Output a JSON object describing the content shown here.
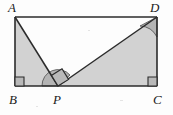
{
  "figure": {
    "type": "geometry-diagram",
    "canvas": {
      "width": 173,
      "height": 115
    },
    "colors": {
      "background": "#fdfdfd",
      "stroke": "#2b2b2b",
      "region_fill": "#d2d2d2",
      "marker_fill": "#b9b9b9",
      "arc_fill": "#b4b4b4",
      "label_color": "#1a1a1a"
    },
    "vertices": [
      {
        "name": "A",
        "label": "A",
        "x": 15,
        "y": 17,
        "label_x": 8,
        "label_y": 1
      },
      {
        "name": "B",
        "label": "B",
        "x": 15,
        "y": 86,
        "label_x": 9,
        "label_y": 93
      },
      {
        "name": "C",
        "label": "C",
        "x": 157,
        "y": 86,
        "label_x": 154,
        "label_y": 93
      },
      {
        "name": "D",
        "label": "D",
        "x": 157,
        "y": 17,
        "label_x": 151,
        "label_y": 1
      },
      {
        "name": "P",
        "label": "P",
        "x": 58,
        "y": 86,
        "label_x": 53,
        "label_y": 93
      }
    ],
    "segments": [
      {
        "name": "side-AB",
        "from": "A",
        "to": "B"
      },
      {
        "name": "side-BC",
        "from": "B",
        "to": "C"
      },
      {
        "name": "side-CD",
        "from": "C",
        "to": "D"
      },
      {
        "name": "side-DA",
        "from": "D",
        "to": "A"
      },
      {
        "name": "segment-AP",
        "from": "A",
        "to": "P"
      },
      {
        "name": "segment-PD",
        "from": "P",
        "to": "D"
      }
    ],
    "shaded_regions": [
      {
        "name": "triangle-ABP",
        "points": "15,17 15,86 58,86"
      },
      {
        "name": "triangle-PCD",
        "points": "58,86 157,86 157,17"
      }
    ],
    "unshaded_regions": [
      {
        "name": "triangle-APD",
        "points": "15,17 58,86 157,17"
      }
    ],
    "right_angle_markers": [
      {
        "name": "right-angle-at-B",
        "vertex": "B",
        "points": "15,78 23,78 23,86 15,86"
      },
      {
        "name": "right-angle-at-C",
        "vertex": "C",
        "points": "149,78 157,78 157,86 149,86"
      },
      {
        "name": "right-angle-at-P",
        "vertex": "P",
        "points": "58,86 52,77 60,71 66,80"
      }
    ],
    "angle_arcs": [
      {
        "name": "angle-arc-at-P",
        "vertex": "P",
        "description": "sector from BP toward PD"
      },
      {
        "name": "angle-arc-at-D",
        "vertex": "D",
        "description": "sector between DP and DC"
      }
    ]
  }
}
